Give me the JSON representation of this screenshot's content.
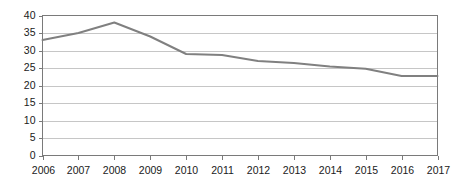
{
  "chart_data": {
    "type": "line",
    "title": "",
    "subtitle": "",
    "xlabel": "",
    "ylabel": "",
    "categories": [
      "2006",
      "2007",
      "2008",
      "2009",
      "2010",
      "2011",
      "2012",
      "2013",
      "2014",
      "2015",
      "2016",
      "2017"
    ],
    "values": [
      33.0,
      35.0,
      38.0,
      34.0,
      29.0,
      28.7,
      27.0,
      26.4,
      25.4,
      24.8,
      22.7,
      22.7
    ],
    "series": [
      {
        "name": "",
        "values": [
          33.0,
          35.0,
          38.0,
          34.0,
          29.0,
          28.7,
          27.0,
          26.4,
          25.4,
          24.8,
          22.7,
          22.7
        ],
        "color": "#808080"
      }
    ],
    "ylim": [
      0,
      40
    ],
    "ytick_values": [
      0,
      5,
      10,
      15,
      20,
      25,
      30,
      35,
      40
    ],
    "ytick_labels": [
      "0",
      "5",
      "10",
      "15",
      "20",
      "25",
      "30",
      "35",
      "40"
    ],
    "xtick_labels": [
      "2006",
      "2007",
      "2008",
      "2009",
      "2010",
      "2011",
      "2012",
      "2013",
      "2014",
      "2015",
      "2016",
      "2017"
    ],
    "grid": true,
    "grid_axis": "y",
    "legend": false,
    "legend_position": "none",
    "annotations": [],
    "colors": {
      "line": "#808080",
      "gridline": "#b8b8b8",
      "frame": "#7a7a7a",
      "text": "#1a1a1a",
      "background": "#ffffff"
    }
  }
}
